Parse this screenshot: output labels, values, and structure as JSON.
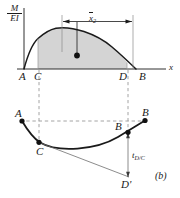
{
  "figure": {
    "label": "(b)",
    "colors": {
      "curve": "#1a1a1a",
      "shade": "#d4d4d4",
      "dashed": "#9a9a9a",
      "thin": "#6e6e6e",
      "background": "#ffffff"
    }
  },
  "top_diagram": {
    "y_axis_label": {
      "numerator": "M",
      "denominator": "EI"
    },
    "x_axis_label": "x",
    "points": [
      {
        "id": "A",
        "label": "A"
      },
      {
        "id": "C",
        "label": "C"
      },
      {
        "id": "D",
        "label": "D"
      },
      {
        "id": "B",
        "label": "B"
      }
    ],
    "dimension": {
      "symbol": "x",
      "overline": true,
      "subscript": "2",
      "label": "x̄₂"
    },
    "centroid_marker": "centroid-dot",
    "shaded_region": "area-between-C-and-D"
  },
  "bottom_diagram": {
    "points": [
      {
        "id": "A",
        "label": "A"
      },
      {
        "id": "C",
        "label": "C"
      },
      {
        "id": "D",
        "label": "D"
      },
      {
        "id": "B",
        "label": "B"
      },
      {
        "id": "Dprime",
        "label": "D'"
      }
    ],
    "deviation": {
      "symbol": "t",
      "subscript": "D/C",
      "label": "tD/C"
    },
    "reference_line": "horizontal-dashed-A-to-B",
    "tangent_line": "tangent-from-C-to-Dprime"
  }
}
